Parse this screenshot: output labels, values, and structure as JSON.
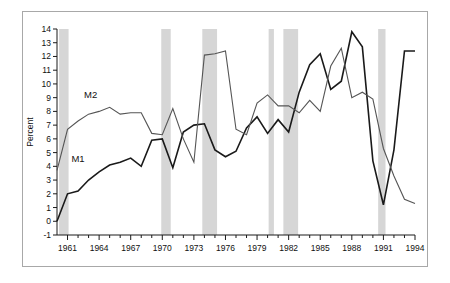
{
  "figure": {
    "frame_color": "#a8a8a8",
    "background": "#ffffff"
  },
  "chart_data": {
    "type": "line",
    "title": "",
    "subtitle": "",
    "xlabel": "",
    "ylabel": "Percent",
    "xlim": [
      1960,
      1994
    ],
    "ylim": [
      -1,
      14
    ],
    "grid": false,
    "legend_position": "inline-annotation",
    "y_ticks": [
      -1,
      0,
      1,
      2,
      3,
      4,
      5,
      6,
      7,
      8,
      9,
      10,
      11,
      12,
      13,
      14
    ],
    "y_tick_labels": [
      "-1",
      "0",
      "1",
      "2",
      "3",
      "4",
      "5",
      "6",
      "7",
      "8",
      "9",
      "10",
      "11",
      "12",
      "13",
      "14"
    ],
    "x_ticks": [
      1961,
      1962,
      1963,
      1964,
      1965,
      1966,
      1967,
      1968,
      1969,
      1970,
      1971,
      1972,
      1973,
      1974,
      1975,
      1976,
      1977,
      1978,
      1979,
      1980,
      1981,
      1982,
      1983,
      1984,
      1985,
      1986,
      1987,
      1988,
      1989,
      1990,
      1991,
      1992,
      1993,
      1994
    ],
    "x_tick_labels_shown": [
      "1961",
      "1964",
      "1967",
      "1970",
      "1973",
      "1976",
      "1979",
      "1982",
      "1985",
      "1988",
      "1991",
      "1994"
    ],
    "x": [
      1960,
      1961,
      1962,
      1963,
      1964,
      1965,
      1966,
      1967,
      1968,
      1969,
      1970,
      1971,
      1972,
      1973,
      1974,
      1975,
      1976,
      1977,
      1978,
      1979,
      1980,
      1981,
      1982,
      1983,
      1984,
      1985,
      1986,
      1987,
      1988,
      1989,
      1990,
      1991,
      1992,
      1993,
      1994
    ],
    "series": [
      {
        "name": "M1",
        "color": "#1a1a1a",
        "width": 1.6,
        "label_x": 1962.0,
        "label_y": 4.3,
        "values": [
          0.0,
          2.0,
          2.2,
          3.0,
          3.6,
          4.1,
          4.3,
          4.6,
          4.0,
          5.9,
          6.0,
          3.9,
          6.5,
          7.0,
          7.1,
          5.2,
          4.7,
          5.1,
          6.8,
          7.6,
          6.4,
          7.4,
          6.5,
          9.4,
          11.4,
          12.2,
          9.6,
          10.2,
          13.8,
          12.7,
          4.4,
          1.2,
          5.2,
          12.4,
          12.4
        ]
      },
      {
        "name": "M2",
        "color": "#555555",
        "width": 1.1,
        "label_x": 1963.2,
        "label_y": 9.0,
        "values": [
          3.7,
          6.7,
          7.3,
          7.8,
          8.0,
          8.3,
          7.8,
          7.9,
          7.9,
          6.4,
          6.3,
          8.2,
          6.0,
          4.3,
          12.1,
          12.2,
          12.4,
          6.7,
          6.3,
          8.6,
          9.2,
          8.4,
          8.4,
          7.9,
          8.8,
          8.0,
          11.3,
          12.6,
          9.0,
          9.4,
          8.9,
          5.3,
          3.3,
          1.6,
          1.3
        ]
      }
    ],
    "recession_bands": [
      {
        "start": 1960.2,
        "end": 1961.1
      },
      {
        "start": 1969.9,
        "end": 1970.8
      },
      {
        "start": 1973.8,
        "end": 1975.2
      },
      {
        "start": 1980.1,
        "end": 1980.6
      },
      {
        "start": 1981.5,
        "end": 1982.9
      },
      {
        "start": 1990.5,
        "end": 1991.2
      }
    ],
    "recession_band_color": "#d6d6d6",
    "annotations": [
      {
        "text": "M1",
        "x": 1962.0,
        "y": 4.3
      },
      {
        "text": "M2",
        "x": 1963.2,
        "y": 9.0
      }
    ]
  }
}
